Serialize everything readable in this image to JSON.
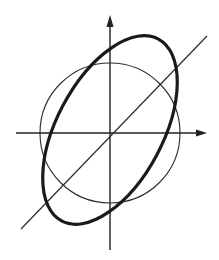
{
  "figure": {
    "title": "",
    "background_color": "#ffffff",
    "width": 219,
    "height": 260
  },
  "chart_data": {
    "type": "scatter",
    "title": "",
    "subtitle": "",
    "xlabel": "",
    "ylabel": "",
    "grid": false,
    "legend": null,
    "tick_labels": {
      "x": [],
      "y": []
    },
    "origin": {
      "x": 110,
      "y": 133
    },
    "axes": {
      "x_axis": {
        "name": "x-axis",
        "x1": 16,
        "y1": 133,
        "x2": 207,
        "y2": 133,
        "arrow_at": "end",
        "color": "#222222",
        "stroke_width": 1.4
      },
      "y_axis": {
        "name": "y-axis",
        "x1": 110,
        "y1": 250,
        "x2": 110,
        "y2": 16,
        "arrow_at": "end",
        "color": "#222222",
        "stroke_width": 1.4
      }
    },
    "shapes": [
      {
        "name": "circle",
        "type": "circle",
        "cx": 110,
        "cy": 133,
        "r": 70,
        "color": "#2b2b2b",
        "stroke_width": 1.1,
        "fill": "none"
      },
      {
        "name": "ellipse",
        "type": "ellipse",
        "cx": 110,
        "cy": 130,
        "rx": 53,
        "ry": 103,
        "rotation_deg": 28,
        "color": "#1a1a1a",
        "stroke_width": 3.2,
        "fill": "none"
      },
      {
        "name": "diagonal-line",
        "type": "line",
        "x1": 21,
        "y1": 229,
        "x2": 207,
        "y2": 36,
        "color": "#2b2b2b",
        "stroke_width": 1.2
      }
    ],
    "series": [
      {
        "name": "circle",
        "kind": "circle",
        "center": [
          0,
          0
        ],
        "radius": 70
      },
      {
        "name": "ellipse",
        "kind": "ellipse",
        "center": [
          0,
          3
        ],
        "semi_major": 103,
        "semi_minor": 53,
        "tilt_deg": 28
      },
      {
        "name": "diagonal",
        "kind": "line",
        "slope": 1.04,
        "intercept": 0
      }
    ],
    "xlim": [
      -94,
      97
    ],
    "ylim": [
      -117,
      117
    ]
  }
}
